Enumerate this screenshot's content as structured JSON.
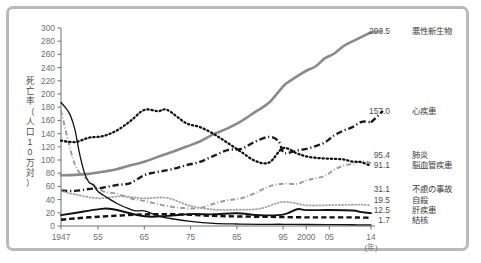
{
  "chart_data": {
    "type": "line",
    "title": "",
    "xlabel": "(年)",
    "ylabel": "死亡率（人口10万対）",
    "ylim": [
      0,
      300
    ],
    "xlim": [
      1947,
      2014
    ],
    "grid": false,
    "legend_position": "right-inline-labels",
    "y_ticks": [
      0,
      20,
      40,
      60,
      80,
      100,
      120,
      140,
      160,
      180,
      200,
      220,
      240,
      260,
      280,
      300
    ],
    "x_ticks": [
      1947,
      1955,
      1965,
      1975,
      1985,
      1995,
      2000,
      2005,
      2014
    ],
    "x_tick_labels": [
      "1947",
      "55",
      "65",
      "75",
      "85",
      "95",
      "2000",
      "05",
      "14"
    ],
    "series": [
      {
        "name": "悪性新生物",
        "end_value": "293.5",
        "color": "#8a8a8a",
        "style": "solid",
        "width": 2.6,
        "label_y": 34,
        "x": [
          1947,
          1950,
          1953,
          1956,
          1959,
          1962,
          1965,
          1968,
          1971,
          1974,
          1977,
          1980,
          1983,
          1986,
          1989,
          1992,
          1995,
          1996,
          1998,
          2000,
          2002,
          2004,
          2006,
          2008,
          2010,
          2012,
          2014
        ],
        "y": [
          76.9,
          77.4,
          79.0,
          82.1,
          86.0,
          92.0,
          97.2,
          105.0,
          112.0,
          120.0,
          128.0,
          139.1,
          148.0,
          159.0,
          173.0,
          187.0,
          211.6,
          217.5,
          226.7,
          235.2,
          241.7,
          253.9,
          261.0,
          272.3,
          279.7,
          286.6,
          293.5
        ]
      },
      {
        "name": "心疾患",
        "end_value": "157.0",
        "color": "#1a1a1a",
        "style": "dashdot",
        "width": 2.4,
        "label_y": 114,
        "x": [
          1947,
          1950,
          1953,
          1956,
          1959,
          1962,
          1965,
          1968,
          1971,
          1974,
          1977,
          1980,
          1983,
          1986,
          1989,
          1992,
          1994,
          1995,
          1996,
          1998,
          2000,
          2002,
          2004,
          2006,
          2008,
          2010,
          2012,
          2014
        ],
        "y": [
          53.6,
          53.2,
          56.0,
          58.0,
          62.0,
          65.0,
          77.0,
          82.0,
          86.0,
          92.0,
          97.0,
          106.2,
          115.0,
          117.0,
          128.0,
          135.0,
          128.6,
          112.0,
          110.8,
          114.3,
          116.8,
          121.0,
          126.5,
          137.2,
          144.4,
          149.8,
          157.9,
          157.0
        ]
      },
      {
        "name": "肺炎",
        "end_value": "95.4",
        "color": "#9a9a9a",
        "style": "dashdot",
        "width": 1.9,
        "label_y": 158,
        "x": [
          1947,
          1950,
          1953,
          1956,
          1959,
          1962,
          1965,
          1968,
          1971,
          1974,
          1977,
          1980,
          1983,
          1986,
          1989,
          1992,
          1995,
          1998,
          2000,
          2002,
          2004,
          2006,
          2008,
          2010,
          2012,
          2014
        ],
        "y": [
          174.8,
          93.2,
          69.0,
          53.0,
          49.0,
          42.0,
          38.0,
          33.0,
          29.0,
          27.0,
          27.0,
          33.7,
          39.0,
          42.0,
          50.0,
          60.0,
          64.1,
          63.8,
          69.2,
          72.3,
          75.7,
          85.0,
          91.6,
          94.1,
          98.4,
          95.4
        ]
      },
      {
        "name": "脳血管疾患",
        "end_value": "91.1",
        "color": "#111111",
        "style": "dotted",
        "width": 2.3,
        "label_y": 168,
        "x": [
          1947,
          1950,
          1953,
          1956,
          1959,
          1962,
          1965,
          1968,
          1970,
          1974,
          1977,
          1980,
          1983,
          1986,
          1989,
          1992,
          1995,
          1998,
          2000,
          2002,
          2004,
          2006,
          2008,
          2010,
          2012,
          2014
        ],
        "y": [
          129.4,
          127.1,
          133.7,
          136.1,
          144.4,
          159.0,
          175.8,
          174.0,
          175.8,
          156.0,
          150.0,
          139.5,
          126.0,
          112.0,
          98.5,
          96.2,
          117.9,
          110.0,
          105.5,
          103.4,
          102.3,
          101.7,
          100.9,
          97.7,
          96.5,
          91.1
        ]
      },
      {
        "name": "不慮の事故",
        "end_value": "31.1",
        "color": "#a5a5a5",
        "style": "dotted",
        "width": 1.8,
        "label_y": 192,
        "x": [
          1947,
          1950,
          1955,
          1960,
          1965,
          1970,
          1975,
          1980,
          1985,
          1990,
          1995,
          2000,
          2005,
          2010,
          2012,
          2014
        ],
        "y": [
          53.1,
          48.0,
          42.0,
          45.0,
          42.0,
          42.5,
          30.3,
          25.0,
          24.6,
          26.2,
          36.5,
          31.4,
          31.6,
          32.2,
          32.4,
          31.1
        ]
      },
      {
        "name": "自殺",
        "end_value": "19.5",
        "color": "#111111",
        "style": "solid",
        "width": 1.9,
        "label_y": 203,
        "x": [
          1947,
          1950,
          1955,
          1958,
          1965,
          1970,
          1975,
          1980,
          1985,
          1990,
          1995,
          1998,
          2000,
          2005,
          2010,
          2012,
          2014
        ],
        "y": [
          16.4,
          19.6,
          25.2,
          25.7,
          14.7,
          15.3,
          18.0,
          17.7,
          19.4,
          16.4,
          17.2,
          25.4,
          24.1,
          24.2,
          23.4,
          21.0,
          19.5
        ]
      },
      {
        "name": "肝疾患",
        "end_value": "12.5",
        "color": "#111111",
        "style": "dashed",
        "width": 2.4,
        "label_y": 213,
        "x": [
          1947,
          1950,
          1955,
          1960,
          1965,
          1970,
          1975,
          1980,
          1985,
          1990,
          1995,
          2000,
          2005,
          2010,
          2012,
          2014
        ],
        "y": [
          9.5,
          11.5,
          14.0,
          16.0,
          17.5,
          18.0,
          17.0,
          15.3,
          14.5,
          14.0,
          13.5,
          13.1,
          13.1,
          13.0,
          12.8,
          12.5
        ]
      },
      {
        "name": "結核",
        "end_value": "1.7",
        "color": "#111111",
        "style": "solid",
        "width": 1.3,
        "label_y": 223,
        "x": [
          1947,
          1948,
          1949,
          1950,
          1951,
          1952,
          1953,
          1954,
          1955,
          1957,
          1959,
          1961,
          1963,
          1965,
          1968,
          1971,
          1975,
          1980,
          1985,
          1990,
          1995,
          2000,
          2005,
          2010,
          2014
        ],
        "y": [
          187.2,
          179.0,
          168.0,
          146.4,
          110.0,
          82.0,
          66.5,
          62.0,
          52.3,
          43.0,
          34.5,
          28.0,
          23.0,
          22.8,
          15.4,
          11.0,
          7.0,
          4.0,
          3.0,
          2.6,
          2.6,
          2.3,
          2.2,
          1.9,
          1.7
        ]
      }
    ]
  }
}
